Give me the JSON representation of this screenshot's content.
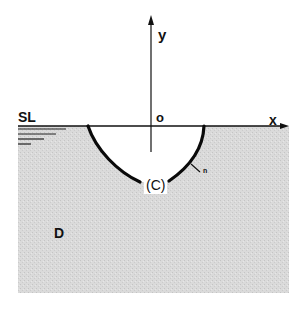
{
  "diagram": {
    "type": "cross-section",
    "labels": {
      "y_axis": "y",
      "x_axis": "x",
      "origin": "o",
      "surface_line": "SL",
      "curve": "(C)",
      "normal": "n",
      "domain": "D"
    },
    "colors": {
      "background": "#ffffff",
      "domain_fill": "#d9d9d9",
      "lines": "#111111",
      "curve": "#0a0a0a"
    }
  }
}
